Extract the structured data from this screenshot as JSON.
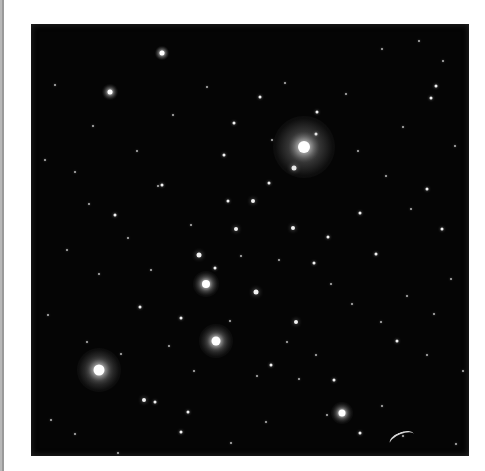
{
  "image": {
    "subject": "star cluster photograph",
    "alt": "Black-and-white astronomical photograph of an open star cluster with many point-like stars and a few bright haloed stars",
    "background_color": "#050505",
    "page_color": "#ffffff",
    "left_bar_color": "#9a9a9a"
  },
  "bright_stars": [
    {
      "x": 273,
      "y": 123,
      "size": 12,
      "halo": 62
    },
    {
      "x": 68,
      "y": 346,
      "size": 11,
      "halo": 44
    },
    {
      "x": 185,
      "y": 317,
      "size": 9,
      "halo": 34
    },
    {
      "x": 175,
      "y": 260,
      "size": 8,
      "halo": 26
    },
    {
      "x": 311,
      "y": 389,
      "size": 7,
      "halo": 22
    },
    {
      "x": 79,
      "y": 68,
      "size": 5,
      "halo": 16
    },
    {
      "x": 131,
      "y": 29,
      "size": 5,
      "halo": 14
    }
  ],
  "stars": [
    {
      "x": 263,
      "y": 144,
      "s": 5
    },
    {
      "x": 285,
      "y": 110,
      "s": 3
    },
    {
      "x": 222,
      "y": 177,
      "s": 4
    },
    {
      "x": 205,
      "y": 205,
      "s": 4
    },
    {
      "x": 262,
      "y": 204,
      "s": 4
    },
    {
      "x": 168,
      "y": 231,
      "s": 5
    },
    {
      "x": 225,
      "y": 268,
      "s": 5
    },
    {
      "x": 265,
      "y": 298,
      "s": 4
    },
    {
      "x": 150,
      "y": 294,
      "s": 3
    },
    {
      "x": 184,
      "y": 244,
      "s": 3
    },
    {
      "x": 238,
      "y": 159,
      "s": 3
    },
    {
      "x": 113,
      "y": 376,
      "s": 4
    },
    {
      "x": 124,
      "y": 378,
      "s": 3
    },
    {
      "x": 157,
      "y": 388,
      "s": 3
    },
    {
      "x": 84,
      "y": 191,
      "s": 3
    },
    {
      "x": 131,
      "y": 161,
      "s": 3
    },
    {
      "x": 127,
      "y": 162,
      "s": 2
    },
    {
      "x": 203,
      "y": 99,
      "s": 3
    },
    {
      "x": 229,
      "y": 73,
      "s": 3
    },
    {
      "x": 193,
      "y": 131,
      "s": 3
    },
    {
      "x": 197,
      "y": 177,
      "s": 3
    },
    {
      "x": 283,
      "y": 239,
      "s": 3
    },
    {
      "x": 297,
      "y": 213,
      "s": 3
    },
    {
      "x": 329,
      "y": 189,
      "s": 3
    },
    {
      "x": 345,
      "y": 230,
      "s": 3
    },
    {
      "x": 396,
      "y": 165,
      "s": 3
    },
    {
      "x": 411,
      "y": 205,
      "s": 3
    },
    {
      "x": 366,
      "y": 317,
      "s": 3
    },
    {
      "x": 396,
      "y": 331,
      "s": 2
    },
    {
      "x": 303,
      "y": 356,
      "s": 3
    },
    {
      "x": 240,
      "y": 341,
      "s": 3
    },
    {
      "x": 226,
      "y": 352,
      "s": 2
    },
    {
      "x": 329,
      "y": 409,
      "s": 3
    },
    {
      "x": 372,
      "y": 412,
      "s": 2
    },
    {
      "x": 412,
      "y": 37,
      "s": 2
    },
    {
      "x": 405,
      "y": 62,
      "s": 3
    },
    {
      "x": 400,
      "y": 74,
      "s": 3
    },
    {
      "x": 388,
      "y": 17,
      "s": 2
    },
    {
      "x": 351,
      "y": 25,
      "s": 2
    },
    {
      "x": 286,
      "y": 88,
      "s": 3
    },
    {
      "x": 142,
      "y": 91,
      "s": 2
    },
    {
      "x": 14,
      "y": 136,
      "s": 2
    },
    {
      "x": 44,
      "y": 148,
      "s": 2
    },
    {
      "x": 17,
      "y": 291,
      "s": 2
    },
    {
      "x": 109,
      "y": 283,
      "s": 3
    },
    {
      "x": 120,
      "y": 246,
      "s": 2
    },
    {
      "x": 56,
      "y": 318,
      "s": 2
    },
    {
      "x": 20,
      "y": 396,
      "s": 2
    },
    {
      "x": 44,
      "y": 410,
      "s": 2
    },
    {
      "x": 87,
      "y": 429,
      "s": 2
    },
    {
      "x": 150,
      "y": 408,
      "s": 3
    },
    {
      "x": 200,
      "y": 419,
      "s": 2
    },
    {
      "x": 235,
      "y": 398,
      "s": 2
    },
    {
      "x": 268,
      "y": 355,
      "s": 2
    },
    {
      "x": 285,
      "y": 331,
      "s": 2
    },
    {
      "x": 300,
      "y": 260,
      "s": 2
    },
    {
      "x": 321,
      "y": 280,
      "s": 2
    },
    {
      "x": 350,
      "y": 298,
      "s": 2
    },
    {
      "x": 376,
      "y": 272,
      "s": 2
    },
    {
      "x": 403,
      "y": 290,
      "s": 2
    },
    {
      "x": 420,
      "y": 255,
      "s": 2
    },
    {
      "x": 380,
      "y": 185,
      "s": 2
    },
    {
      "x": 355,
      "y": 152,
      "s": 2
    },
    {
      "x": 327,
      "y": 127,
      "s": 2
    },
    {
      "x": 315,
      "y": 70,
      "s": 2
    },
    {
      "x": 254,
      "y": 59,
      "s": 2
    },
    {
      "x": 176,
      "y": 63,
      "s": 2
    },
    {
      "x": 106,
      "y": 127,
      "s": 2
    },
    {
      "x": 62,
      "y": 102,
      "s": 2
    },
    {
      "x": 24,
      "y": 61,
      "s": 2
    },
    {
      "x": 36,
      "y": 226,
      "s": 2
    },
    {
      "x": 68,
      "y": 250,
      "s": 2
    },
    {
      "x": 90,
      "y": 330,
      "s": 2
    },
    {
      "x": 210,
      "y": 232,
      "s": 2
    },
    {
      "x": 248,
      "y": 236,
      "s": 2
    },
    {
      "x": 256,
      "y": 318,
      "s": 2
    },
    {
      "x": 199,
      "y": 297,
      "s": 2
    },
    {
      "x": 163,
      "y": 347,
      "s": 2
    },
    {
      "x": 138,
      "y": 322,
      "s": 2
    },
    {
      "x": 296,
      "y": 391,
      "s": 2
    },
    {
      "x": 351,
      "y": 382,
      "s": 2
    },
    {
      "x": 425,
      "y": 420,
      "s": 2
    },
    {
      "x": 432,
      "y": 347,
      "s": 2
    },
    {
      "x": 424,
      "y": 122,
      "s": 2
    },
    {
      "x": 372,
      "y": 103,
      "s": 2
    },
    {
      "x": 241,
      "y": 116,
      "s": 2
    },
    {
      "x": 160,
      "y": 201,
      "s": 2
    },
    {
      "x": 97,
      "y": 214,
      "s": 2
    },
    {
      "x": 58,
      "y": 180,
      "s": 2
    }
  ],
  "streak": {
    "x": 358,
    "y": 408
  }
}
